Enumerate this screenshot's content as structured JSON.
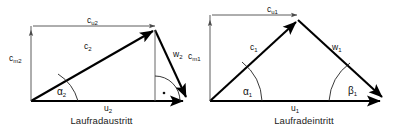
{
  "figure": {
    "type": "velocity-triangles",
    "background_color": "#ffffff",
    "stroke_color": "#000000",
    "thin_stroke_color": "#555555"
  },
  "diagrams": [
    {
      "id": "outlet",
      "caption": "Laufradaustritt",
      "labels": {
        "cu": "c",
        "cu_sub": "u2",
        "cm": "c",
        "cm_sub": "m2",
        "c": "c",
        "c_sub": "2",
        "w": "w",
        "w_sub": "2",
        "u": "u",
        "u_sub": "2",
        "alpha": "α",
        "alpha_sub": "2",
        "right_angle": "·"
      }
    },
    {
      "id": "inlet",
      "caption": "Laufradeintritt",
      "labels": {
        "cu": "c",
        "cu_sub": "u1",
        "cm": "c",
        "cm_sub": "m1",
        "c": "c",
        "c_sub": "1",
        "w": "w",
        "w_sub": "1",
        "u": "u",
        "u_sub": "1",
        "alpha": "α",
        "alpha_sub": "1",
        "beta": "β",
        "beta_sub": "1"
      }
    }
  ]
}
